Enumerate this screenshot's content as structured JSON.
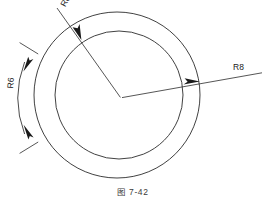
{
  "figure": {
    "caption": "图 7-42",
    "caption_number": "7-42",
    "background_color": "#ffffff",
    "line_color": "#2b2b2b",
    "text_color": "#1a1a1a"
  },
  "labels": {
    "outer_radius": "R8",
    "inner_radius": "R8",
    "arc_dimension": "R6"
  },
  "geometry": {
    "center": {
      "x": 121,
      "y": 98
    },
    "outer_circle": {
      "cx": 117,
      "cy": 95,
      "r": 83
    },
    "inner_circle": {
      "cx": 119,
      "cy": 95,
      "r": 64
    },
    "leader_right": {
      "x1": 121,
      "y1": 98,
      "x2": 262,
      "y2": 73
    },
    "leader_upper_left": {
      "x1": 121,
      "y1": 98,
      "x2": 57,
      "y2": 8
    },
    "dimension_arc": {
      "cx": 121,
      "cy": 98,
      "r": 101,
      "start_deg": 196,
      "end_deg": 164
    }
  }
}
